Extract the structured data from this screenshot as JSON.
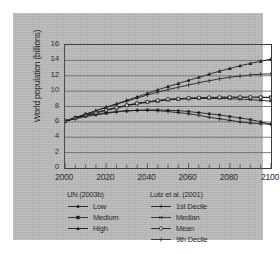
{
  "chart_data": {
    "type": "line",
    "title": "",
    "xlabel": "",
    "ylabel": "World population (billions)",
    "xlim": [
      2000,
      2100
    ],
    "ylim": [
      0,
      16
    ],
    "xticks": [
      2000,
      2020,
      2040,
      2060,
      2080,
      2100
    ],
    "yticks": [
      0,
      2,
      4,
      6,
      8,
      10,
      12,
      14,
      16
    ],
    "minor_xtick_interval": 5,
    "grid": "horizontal",
    "legend_position": "below",
    "x": [
      2000,
      2005,
      2010,
      2015,
      2020,
      2025,
      2030,
      2035,
      2040,
      2045,
      2050,
      2055,
      2060,
      2065,
      2070,
      2075,
      2080,
      2085,
      2090,
      2095,
      2100
    ],
    "series": [
      {
        "name": "Low",
        "group": "UN (2003b)",
        "marker": "square-small",
        "values": [
          6.1,
          6.4,
          6.7,
          6.9,
          7.1,
          7.3,
          7.4,
          7.5,
          7.55,
          7.55,
          7.5,
          7.45,
          7.35,
          7.2,
          7.05,
          6.9,
          6.7,
          6.5,
          6.3,
          6.0,
          5.7
        ]
      },
      {
        "name": "Medium",
        "group": "UN (2003b)",
        "marker": "square",
        "values": [
          6.1,
          6.5,
          6.85,
          7.2,
          7.55,
          7.85,
          8.15,
          8.4,
          8.6,
          8.75,
          8.9,
          9.0,
          9.05,
          9.1,
          9.15,
          9.18,
          9.2,
          9.2,
          9.2,
          9.2,
          9.2
        ]
      },
      {
        "name": "High",
        "group": "UN (2003b)",
        "marker": "triangle",
        "values": [
          6.1,
          6.55,
          7.0,
          7.45,
          7.9,
          8.35,
          8.8,
          9.25,
          9.7,
          10.15,
          10.6,
          11.0,
          11.4,
          11.8,
          12.2,
          12.6,
          12.95,
          13.3,
          13.6,
          13.9,
          14.15
        ]
      },
      {
        "name": "1st Decile",
        "group": "Lutz et al. (2001)",
        "marker": "plus",
        "values": [
          6.1,
          6.45,
          6.75,
          7.0,
          7.2,
          7.35,
          7.45,
          7.5,
          7.5,
          7.45,
          7.35,
          7.2,
          7.05,
          6.85,
          6.6,
          6.4,
          6.2,
          6.0,
          5.85,
          5.75,
          5.7
        ]
      },
      {
        "name": "Median",
        "group": "Lutz et al. (2001)",
        "marker": "asterisk",
        "values": [
          6.1,
          6.5,
          6.85,
          7.2,
          7.5,
          7.8,
          8.1,
          8.35,
          8.55,
          8.7,
          8.85,
          8.95,
          9.0,
          9.05,
          9.05,
          9.05,
          9.0,
          8.95,
          8.9,
          8.8,
          8.7
        ]
      },
      {
        "name": "Mean",
        "group": "Lutz et al. (2001)",
        "marker": "circle",
        "values": [
          6.1,
          6.5,
          6.9,
          7.2,
          7.55,
          7.85,
          8.15,
          8.4,
          8.6,
          8.8,
          8.95,
          9.0,
          9.1,
          9.15,
          9.18,
          9.2,
          9.2,
          9.2,
          9.2,
          9.2,
          9.15
        ]
      },
      {
        "name": "9th Decile",
        "group": "Lutz et al. (2001)",
        "marker": "vline",
        "values": [
          6.1,
          6.55,
          7.0,
          7.45,
          7.9,
          8.3,
          8.7,
          9.1,
          9.5,
          9.85,
          10.2,
          10.5,
          10.8,
          11.1,
          11.35,
          11.6,
          11.8,
          11.95,
          12.1,
          12.2,
          12.25
        ]
      }
    ]
  },
  "legend": {
    "groups": [
      {
        "title": "UN (2003b)",
        "items": [
          {
            "label": "Low",
            "marker": "square-small"
          },
          {
            "label": "Medium",
            "marker": "square"
          },
          {
            "label": "High",
            "marker": "triangle"
          }
        ]
      },
      {
        "title": "Lutz et al. (2001)",
        "items": [
          {
            "label": "1st Decile",
            "marker": "plus"
          },
          {
            "label": "Median",
            "marker": "asterisk"
          },
          {
            "label": "Mean",
            "marker": "circle"
          },
          {
            "label": "9th Decile",
            "marker": "vline"
          }
        ]
      }
    ]
  },
  "colors": {
    "panel_background": "#b9b9b9",
    "line": "#141414",
    "grid": "#5a5a5a",
    "axis": "#3a3a3a",
    "text": "#1a1a1a"
  }
}
